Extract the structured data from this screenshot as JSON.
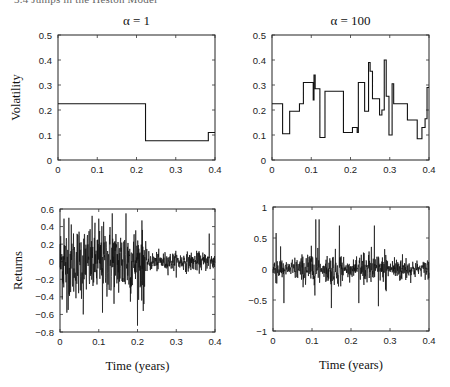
{
  "running_header": "3.4   Jumps in the Heston Model",
  "chart_data": [
    {
      "id": "vol_alpha1",
      "type": "line",
      "step": true,
      "title": "α = 1",
      "xlabel": "",
      "ylabel": "Volatility",
      "xlim": [
        0,
        0.4
      ],
      "ylim": [
        0,
        0.5
      ],
      "xticks": [
        "0",
        "0.1",
        "0.2",
        "0.3",
        "0.4"
      ],
      "yticks": [
        "0",
        "0.1",
        "0.2",
        "0.3",
        "0.4",
        "0.5"
      ],
      "x": [
        0,
        0.223,
        0.223,
        0.383,
        0.383,
        0.4
      ],
      "y": [
        0.225,
        0.225,
        0.077,
        0.077,
        0.11,
        0.11
      ],
      "grid": false
    },
    {
      "id": "vol_alpha100",
      "type": "line",
      "step": true,
      "title": "α = 100",
      "xlabel": "",
      "ylabel": "",
      "xlim": [
        0,
        0.4
      ],
      "ylim": [
        0,
        0.5
      ],
      "xticks": [
        "0",
        "0.1",
        "0.2",
        "0.3",
        "0.4"
      ],
      "yticks": [
        "0",
        "0.1",
        "0.2",
        "0.3",
        "0.4",
        "0.5"
      ],
      "x": [
        0,
        0.027,
        0.027,
        0.045,
        0.045,
        0.07,
        0.07,
        0.08,
        0.08,
        0.105,
        0.105,
        0.107,
        0.107,
        0.11,
        0.11,
        0.122,
        0.122,
        0.135,
        0.135,
        0.182,
        0.182,
        0.205,
        0.205,
        0.217,
        0.217,
        0.22,
        0.22,
        0.236,
        0.236,
        0.246,
        0.246,
        0.25,
        0.25,
        0.256,
        0.256,
        0.274,
        0.274,
        0.28,
        0.28,
        0.286,
        0.286,
        0.291,
        0.291,
        0.298,
        0.298,
        0.306,
        0.306,
        0.31,
        0.31,
        0.345,
        0.345,
        0.37,
        0.37,
        0.382,
        0.382,
        0.39,
        0.39,
        0.395,
        0.395,
        0.4
      ],
      "y": [
        0.225,
        0.225,
        0.105,
        0.105,
        0.195,
        0.195,
        0.225,
        0.225,
        0.31,
        0.31,
        0.24,
        0.24,
        0.34,
        0.34,
        0.285,
        0.285,
        0.09,
        0.09,
        0.275,
        0.275,
        0.11,
        0.11,
        0.13,
        0.13,
        0.11,
        0.11,
        0.31,
        0.31,
        0.195,
        0.195,
        0.39,
        0.39,
        0.355,
        0.355,
        0.245,
        0.245,
        0.18,
        0.18,
        0.2,
        0.2,
        0.4,
        0.4,
        0.255,
        0.255,
        0.1,
        0.1,
        0.305,
        0.305,
        0.225,
        0.225,
        0.16,
        0.16,
        0.085,
        0.085,
        0.13,
        0.13,
        0.165,
        0.165,
        0.29,
        0.29
      ],
      "grid": false
    },
    {
      "id": "ret_alpha1",
      "type": "line",
      "title": "",
      "xlabel": "Time (years)",
      "ylabel": "Returns",
      "xlim": [
        0,
        0.4
      ],
      "ylim": [
        -0.8,
        0.6
      ],
      "xticks": [
        "0",
        "0.1",
        "0.2",
        "0.3",
        "0.4"
      ],
      "yticks": [
        "−0.8",
        "−0.6",
        "−0.4",
        "−0.2",
        "0",
        "0.2",
        "0.4",
        "0.6"
      ],
      "description": "Noisy return series; high-amplitude (about ±0.55) until t≈0.22, then low amplitude (about ±0.15)",
      "notable_extremes": [
        {
          "x": 0.01,
          "y": 0.49
        },
        {
          "x": 0.018,
          "y": -0.58
        },
        {
          "x": 0.023,
          "y": 0.5
        },
        {
          "x": 0.06,
          "y": -0.6
        },
        {
          "x": 0.1,
          "y": 0.49
        },
        {
          "x": 0.11,
          "y": -0.58
        },
        {
          "x": 0.135,
          "y": 0.55
        },
        {
          "x": 0.17,
          "y": 0.55
        },
        {
          "x": 0.215,
          "y": -0.56
        },
        {
          "x": 0.385,
          "y": 0.32
        }
      ],
      "regimes": [
        {
          "x_from": 0,
          "x_to": 0.222,
          "amplitude": 0.55
        },
        {
          "x_from": 0.222,
          "x_to": 0.4,
          "amplitude": 0.14
        }
      ],
      "grid": false
    },
    {
      "id": "ret_alpha100",
      "type": "line",
      "title": "",
      "xlabel": "Time (years)",
      "ylabel": "",
      "xlim": [
        0,
        0.4
      ],
      "ylim": [
        -1,
        1
      ],
      "xticks": [
        "0",
        "0.1",
        "0.2",
        "0.3",
        "0.4"
      ],
      "yticks": [
        "−1",
        "−0.5",
        "0",
        "0.5",
        "1"
      ],
      "description": "Noisy return series with volatility clustering following the α=100 volatility path",
      "notable_extremes": [
        {
          "x": 0.008,
          "y": 0.58
        },
        {
          "x": 0.028,
          "y": -0.55
        },
        {
          "x": 0.11,
          "y": 0.8
        },
        {
          "x": 0.118,
          "y": 0.8
        },
        {
          "x": 0.15,
          "y": -0.63
        },
        {
          "x": 0.17,
          "y": 0.7
        },
        {
          "x": 0.22,
          "y": -0.55
        },
        {
          "x": 0.26,
          "y": 0.7
        },
        {
          "x": 0.27,
          "y": -0.6
        }
      ],
      "grid": false
    }
  ]
}
